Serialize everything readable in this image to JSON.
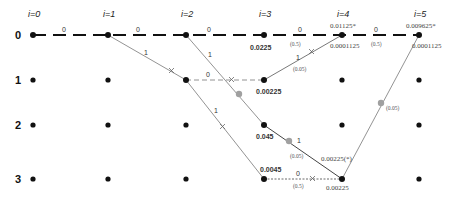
{
  "columns": [
    {
      "label": "i=0",
      "x": 33
    },
    {
      "label": "i=1",
      "x": 108
    },
    {
      "label": "i=2",
      "x": 186
    },
    {
      "label": "i=3",
      "x": 264
    },
    {
      "label": "i=4",
      "x": 342
    },
    {
      "label": "i=5",
      "x": 419
    }
  ],
  "rows": [
    {
      "label": "0",
      "y": 35
    },
    {
      "label": "1",
      "y": 80
    },
    {
      "label": "2",
      "y": 125
    },
    {
      "label": "3",
      "y": 179
    }
  ],
  "edge_labels": {
    "top_0_1": "0",
    "top_1_2": "0",
    "top_2_3": "0",
    "top_3_4": "0",
    "top_4_5": "0",
    "diag_1_0_to_2_1": "1",
    "diag_2_0_to_3_2": "1",
    "row1_2_to_3": "0",
    "diag_2_1_to_3_3": "1",
    "diag_3_1_to_4_0": "1",
    "diag_3_2_to_4_3": "1",
    "row3_3_to_4": "0"
  },
  "probabilities": {
    "top_3_4": "(0.5)",
    "top_4_5": "(0.5)",
    "diag_3_1_to_4_0": "(0.05)",
    "diag_3_2_to_4_3": "(0.05)",
    "row3_3_to_4": "(0.5)",
    "diag_4_3_to_5_0": "(0.05)"
  },
  "node_values": {
    "n3_0": "0.0225",
    "n3_1": "0.00225",
    "n3_2": "0.045",
    "n3_3": "0.0045",
    "n4_0_top": "0.01125*",
    "n4_0_bottom": "0.0001125",
    "n5_0_top": "0.009625*",
    "n5_0_bottom": "0.0001125",
    "n4_3_diag": "0.00225(*)",
    "n4_3_bottom": "0.00225"
  },
  "colors": {
    "node": "#111111",
    "thick_path": "#111111",
    "thin_edge": "#777777",
    "marker_gray": "#9a9a9a"
  }
}
